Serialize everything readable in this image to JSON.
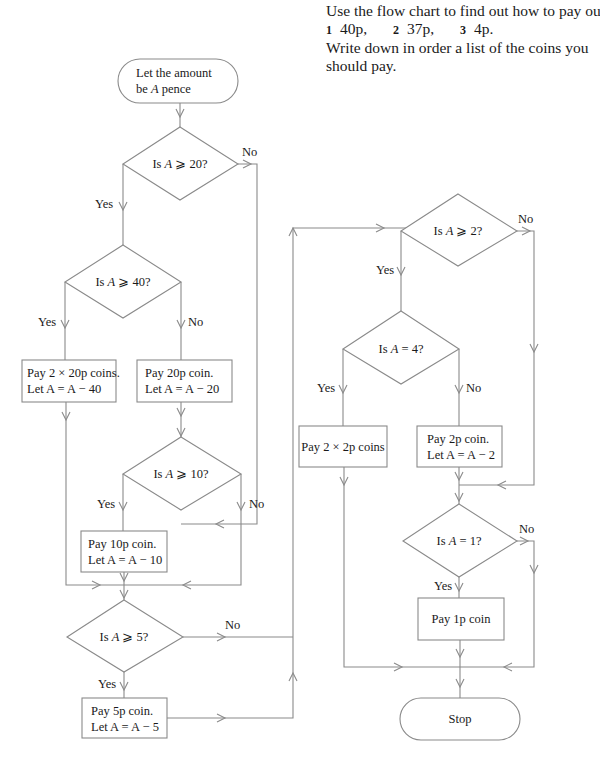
{
  "instructions": {
    "line1": "Use the flow chart to find out how to pay out",
    "questions": [
      {
        "num": "1",
        "amount": "40p,"
      },
      {
        "num": "2",
        "amount": "37p,"
      },
      {
        "num": "3",
        "amount": "4p."
      }
    ],
    "line3": "Write down in order a list of the coins you",
    "line4": "should pay."
  },
  "flowchart": {
    "start": {
      "line1": "Let the amount",
      "line2_pre": "be ",
      "line2_var": "A",
      "line2_post": " pence"
    },
    "decisions": {
      "d20": {
        "pre": "Is ",
        "var": "A",
        "post": " ⩾ 20?"
      },
      "d40": {
        "pre": "Is ",
        "var": "A",
        "post": " ⩾ 40?"
      },
      "d10": {
        "pre": "Is ",
        "var": "A",
        "post": " ⩾ 10?"
      },
      "d5": {
        "pre": "Is ",
        "var": "A",
        "post": " ⩾ 5?"
      },
      "d2": {
        "pre": "Is ",
        "var": "A",
        "post": " ⩾ 2?"
      },
      "d4": {
        "pre": "Is ",
        "var": "A",
        "post": " = 4?"
      },
      "d1": {
        "pre": "Is ",
        "var": "A",
        "post": " = 1?"
      }
    },
    "processes": {
      "p2x20": {
        "line1": "Pay 2 × 20p coins.",
        "line2": "Let A = A − 40"
      },
      "p20": {
        "line1": "Pay 20p coin.",
        "line2": "Let A = A − 20"
      },
      "p10": {
        "line1": "Pay 10p coin.",
        "line2": "Let A = A − 10"
      },
      "p5": {
        "line1": "Pay 5p coin.",
        "line2": "Let A = A − 5"
      },
      "p2x2": {
        "line1": "Pay 2 × 2p coins"
      },
      "p2": {
        "line1": "Pay 2p coin.",
        "line2": "Let A = A − 2"
      },
      "p1": {
        "line1": "Pay 1p coin"
      }
    },
    "end": {
      "label": "Stop"
    },
    "labels": {
      "yes": "Yes",
      "no": "No"
    }
  }
}
